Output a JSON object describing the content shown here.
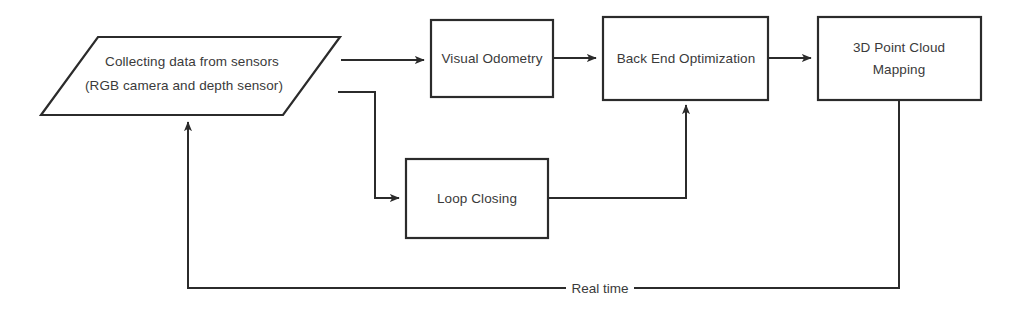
{
  "diagram": {
    "background_color": "#ffffff",
    "line_color": "#2b2b2b",
    "text_color": "#3a3a3a",
    "nodes": [
      {
        "id": "sensor-input",
        "shape": "parallelogram",
        "line1": "Collecting data from sensors",
        "line2": "(RGB camera and depth sensor)"
      },
      {
        "id": "visual-odometry",
        "shape": "rectangle",
        "line1": "Visual Odometry",
        "line2": ""
      },
      {
        "id": "back-end-optimization",
        "shape": "rectangle",
        "line1": "Back End Optimization",
        "line2": ""
      },
      {
        "id": "point-cloud-mapping",
        "shape": "rectangle",
        "line1": "3D Point Cloud",
        "line2": "Mapping"
      },
      {
        "id": "loop-closing",
        "shape": "rectangle",
        "line1": "Loop Closing",
        "line2": ""
      }
    ],
    "edges": [
      {
        "id": "sensor-to-vo",
        "label": ""
      },
      {
        "id": "vo-to-backend",
        "label": ""
      },
      {
        "id": "backend-to-mapping",
        "label": ""
      },
      {
        "id": "sensor-to-loop",
        "label": ""
      },
      {
        "id": "loop-to-backend",
        "label": ""
      },
      {
        "id": "mapping-to-sensor",
        "label": "Real time"
      }
    ]
  }
}
